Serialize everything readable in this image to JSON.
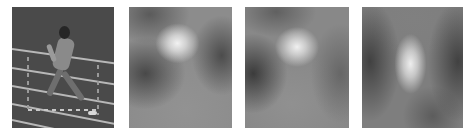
{
  "figure": {
    "panels": [
      {
        "id": "original",
        "description": "grayscale video frame of a sprinter running on a track",
        "background": "#4a4a4a"
      },
      {
        "id": "saliency-map-1",
        "description": "blurred grayscale saliency heatmap, bright spot upper-center",
        "peak": [
          0.47,
          0.3
        ]
      },
      {
        "id": "saliency-map-2",
        "description": "blurred grayscale saliency heatmap, bright spot upper-center",
        "peak": [
          0.5,
          0.33
        ]
      },
      {
        "id": "saliency-map-3",
        "description": "blurred grayscale saliency heatmap, elongated bright spot center",
        "peak": [
          0.48,
          0.47
        ]
      }
    ],
    "background": "#ffffff"
  }
}
